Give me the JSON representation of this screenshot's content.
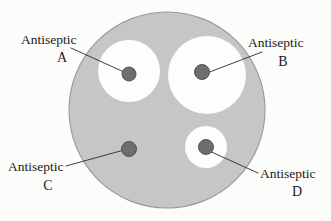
{
  "figure": {
    "background_color": "#fcfcfb",
    "plate": {
      "name": "agar-plate",
      "fill_color": "#c6c6c6",
      "stroke_color": "#9a9a9a",
      "center_x": 167,
      "center_y": 110,
      "radius": 98
    },
    "zone_fill_color": "#fdfdfd",
    "disk_fill_color": "#6e6e6e",
    "disk_stroke_color": "#4a4a4a",
    "leader_color": "#2a2a2a"
  },
  "chart_data": {
    "type": "diagram",
    "xlabel": "",
    "ylabel": "",
    "items": [
      {
        "id": "A",
        "label": "Antiseptic",
        "letter": "A",
        "zone_radius": 31,
        "disk_radius": 7,
        "zone_center_x": 129,
        "zone_center_y": 71,
        "disk_center_x": 129,
        "disk_center_y": 74,
        "has_zone": true
      },
      {
        "id": "B",
        "label": "Antiseptic",
        "letter": "B",
        "zone_radius": 39,
        "disk_radius": 7.5,
        "zone_center_x": 207,
        "zone_center_y": 75,
        "disk_center_x": 202,
        "disk_center_y": 72,
        "has_zone": true
      },
      {
        "id": "C",
        "label": "Antiseptic",
        "letter": "C",
        "zone_radius": 0,
        "disk_radius": 7.5,
        "zone_center_x": 129,
        "zone_center_y": 149,
        "disk_center_x": 129,
        "disk_center_y": 149,
        "has_zone": false
      },
      {
        "id": "D",
        "label": "Antiseptic",
        "letter": "D",
        "zone_radius": 21,
        "disk_radius": 7.5,
        "zone_center_x": 206,
        "zone_center_y": 147,
        "disk_center_x": 206,
        "disk_center_y": 147,
        "has_zone": true
      }
    ]
  },
  "labels": {
    "a": {
      "word": "Antiseptic",
      "letter": "A"
    },
    "b": {
      "word": "Antiseptic",
      "letter": "B"
    },
    "c": {
      "word": "Antiseptic",
      "letter": "C"
    },
    "d": {
      "word": "Antiseptic",
      "letter": "D"
    }
  }
}
